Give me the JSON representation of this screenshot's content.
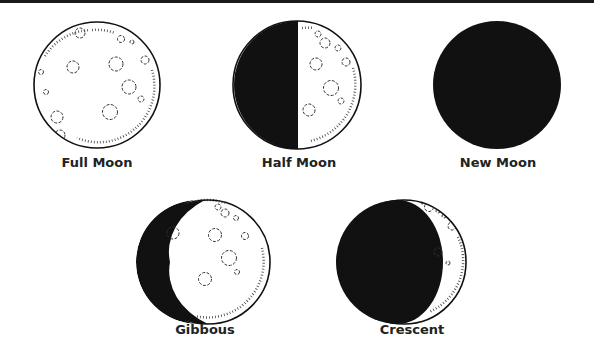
{
  "colors": {
    "dark": "#111111",
    "light": "#ffffff",
    "outline": "#111111"
  },
  "phases": [
    {
      "id": "full",
      "label": "Full Moon",
      "type": "full"
    },
    {
      "id": "half",
      "label": "Half Moon",
      "type": "half"
    },
    {
      "id": "new",
      "label": "New Moon",
      "type": "new"
    },
    {
      "id": "gibbous",
      "label": "Gibbous",
      "type": "gibbous"
    },
    {
      "id": "crescent",
      "label": "Crescent",
      "type": "crescent"
    }
  ]
}
